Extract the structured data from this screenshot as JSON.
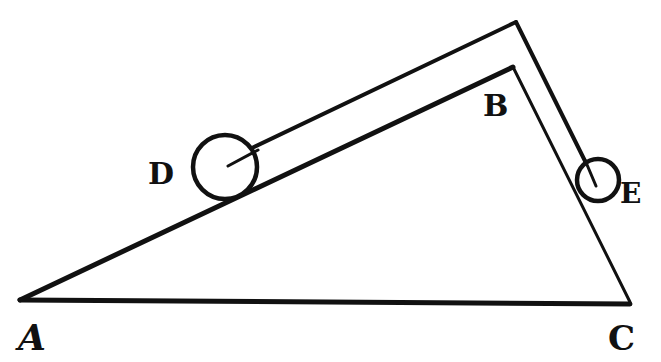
{
  "diagram": {
    "colors": {
      "ink": "#111111",
      "background": "#ffffff"
    },
    "points": {
      "A": {
        "label": "A",
        "x": 20,
        "y": 300
      },
      "B": {
        "label": "B",
        "x": 513,
        "y": 67
      },
      "C": {
        "label": "C",
        "x": 630,
        "y": 302
      },
      "apex_outer": {
        "x": 516,
        "y": 22
      }
    },
    "balls": {
      "D": {
        "label": "D",
        "cx": 225,
        "cy": 167,
        "r": 32
      },
      "E": {
        "label": "E",
        "cx": 598,
        "cy": 180,
        "r": 21
      }
    },
    "labels": {
      "A": "A",
      "B": "B",
      "C": "C",
      "D": "D",
      "E": "E"
    }
  }
}
